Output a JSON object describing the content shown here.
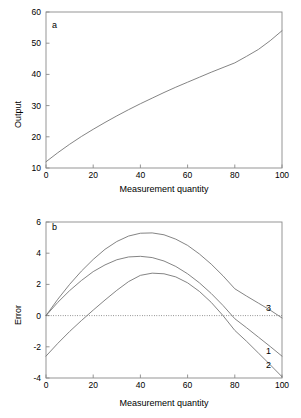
{
  "figure": {
    "background": "#ffffff",
    "axis_color": "#8a8a8a",
    "curve_color": "#6e6e6e",
    "text_color": "#000000"
  },
  "panels": [
    {
      "id": "a",
      "letter": "a",
      "xlabel": "Measurement quantity",
      "ylabel": "Output",
      "xticks": [
        "0",
        "20",
        "40",
        "60",
        "80",
        "100"
      ],
      "yticks": [
        "10",
        "20",
        "30",
        "40",
        "50",
        "60"
      ]
    },
    {
      "id": "b",
      "letter": "b",
      "xlabel": "Measurement quantity",
      "ylabel": "Error",
      "xticks": [
        "0",
        "20",
        "40",
        "60",
        "80",
        "100"
      ],
      "yticks": [
        "-4",
        "-2",
        "0",
        "2",
        "4",
        "6"
      ],
      "curve_labels": [
        "1",
        "2",
        "3"
      ]
    }
  ],
  "chart_data": [
    {
      "type": "line",
      "panel": "a",
      "title": "a",
      "xlabel": "Measurement quantity",
      "ylabel": "Output",
      "xlim": [
        0,
        100
      ],
      "ylim": [
        10,
        60
      ],
      "xticks": [
        0,
        20,
        40,
        60,
        80,
        100
      ],
      "yticks": [
        10,
        20,
        30,
        40,
        50,
        60
      ],
      "grid": false,
      "legend": "none",
      "series": [
        {
          "name": "calibration-curve",
          "x": [
            0,
            5,
            10,
            15,
            20,
            25,
            30,
            35,
            40,
            45,
            50,
            55,
            60,
            65,
            70,
            75,
            80,
            85,
            90,
            95,
            100
          ],
          "values": [
            12.0,
            14.9,
            17.6,
            20.1,
            22.4,
            24.6,
            26.7,
            28.7,
            30.6,
            32.4,
            34.2,
            35.9,
            37.5,
            39.1,
            40.7,
            42.2,
            43.7,
            45.8,
            48.0,
            50.8,
            54.0
          ]
        }
      ]
    },
    {
      "type": "line",
      "panel": "b",
      "title": "b",
      "xlabel": "Measurement quantity",
      "ylabel": "Error",
      "xlim": [
        0,
        100
      ],
      "ylim": [
        -4,
        6
      ],
      "xticks": [
        0,
        20,
        40,
        60,
        80,
        100
      ],
      "yticks": [
        -4,
        -2,
        0,
        2,
        4,
        6
      ],
      "grid": false,
      "zero_line": 0,
      "zero_line_style": "dotted",
      "legend": "inline-end-labels",
      "series": [
        {
          "name": "3",
          "x": [
            0,
            5,
            10,
            15,
            20,
            25,
            30,
            35,
            40,
            45,
            50,
            55,
            60,
            65,
            70,
            75,
            80,
            85,
            90,
            95,
            100
          ],
          "values": [
            0.0,
            1.05,
            2.0,
            2.85,
            3.6,
            4.25,
            4.75,
            5.1,
            5.28,
            5.3,
            5.18,
            4.9,
            4.5,
            3.95,
            3.3,
            2.55,
            1.72,
            1.25,
            0.8,
            0.35,
            -0.15
          ]
        },
        {
          "name": "1",
          "x": [
            0,
            5,
            10,
            15,
            20,
            25,
            30,
            35,
            40,
            45,
            50,
            55,
            60,
            65,
            70,
            75,
            80,
            85,
            90,
            95,
            100
          ],
          "values": [
            0.0,
            0.85,
            1.6,
            2.25,
            2.82,
            3.25,
            3.58,
            3.76,
            3.8,
            3.72,
            3.5,
            3.15,
            2.68,
            2.1,
            1.42,
            0.65,
            -0.2,
            -0.78,
            -1.38,
            -1.98,
            -2.6
          ]
        },
        {
          "name": "2",
          "x": [
            0,
            5,
            10,
            15,
            20,
            25,
            30,
            35,
            40,
            45,
            50,
            55,
            60,
            65,
            70,
            75,
            80,
            85,
            90,
            95,
            100
          ],
          "values": [
            -2.6,
            -1.78,
            -1.02,
            -0.32,
            0.35,
            1.0,
            1.62,
            2.18,
            2.58,
            2.72,
            2.68,
            2.48,
            2.1,
            1.55,
            0.85,
            0.0,
            -0.95,
            -1.65,
            -2.4,
            -3.15,
            -3.92
          ]
        }
      ]
    }
  ]
}
